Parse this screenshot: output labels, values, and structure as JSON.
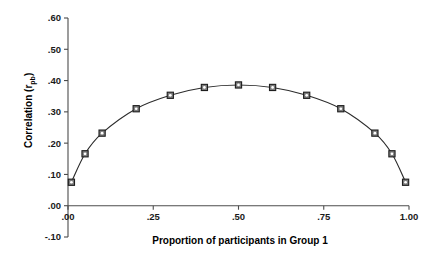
{
  "chart_data": {
    "type": "line",
    "title": "",
    "subtitle": "",
    "xlabel": "Proportion of participants in Group 1",
    "ylabel": "Correlation (r",
    "ylabel_subscript": "pb",
    "ylabel_suffix": ")",
    "ylabel_full": "Correlation (rpb)",
    "xlim": [
      0.0,
      1.0
    ],
    "ylim": [
      -0.1,
      0.6
    ],
    "xticks": [
      0.0,
      0.25,
      0.5,
      0.75,
      1.0
    ],
    "xtick_labels": [
      ".00",
      ".25",
      ".50",
      ".75",
      "1.00"
    ],
    "yticks": [
      -0.1,
      0.0,
      0.1,
      0.2,
      0.3,
      0.4,
      0.5,
      0.6
    ],
    "ytick_labels": [
      "-.10",
      ".00",
      ".10",
      ".20",
      ".30",
      ".40",
      ".50",
      ".60"
    ],
    "grid": false,
    "legend": false,
    "legend_position": "none",
    "marker": "square-open",
    "series": [
      {
        "name": "Point-biserial correlation",
        "x": [
          0.01,
          0.05,
          0.1,
          0.2,
          0.3,
          0.4,
          0.5,
          0.6,
          0.7,
          0.8,
          0.9,
          0.95,
          0.99
        ],
        "values": [
          0.075,
          0.166,
          0.232,
          0.31,
          0.353,
          0.378,
          0.386,
          0.378,
          0.353,
          0.31,
          0.232,
          0.166,
          0.075
        ]
      }
    ]
  },
  "axes": {
    "x_title": "Proportion of participants in Group 1",
    "y_title_main": "Correlation (r",
    "y_title_sub": "pb",
    "y_title_end": ")"
  },
  "colors": {
    "line": "#2b2b2b",
    "marker_fill": "#7d7d7d",
    "marker_edge": "#1d1d1d",
    "axis": "#4c4c4c",
    "text": "#000000",
    "background": "#ffffff"
  }
}
